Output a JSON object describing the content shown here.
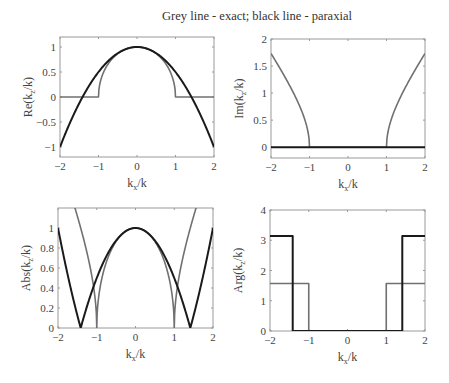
{
  "figure": {
    "title": "Grey line - exact; black line - paraxial",
    "colors": {
      "exact": "#707070",
      "paraxial": "#1a1a1a",
      "axes": "#9a9a9a",
      "text": "#444444"
    }
  },
  "chart_data": [
    {
      "id": "re",
      "type": "line",
      "title": "",
      "xlabel": "k_x/k",
      "ylabel": "Re(k_z/k)",
      "xlim": [
        -2,
        2
      ],
      "ylim": [
        -1.2,
        1.2
      ],
      "xticks": [
        -2,
        -1,
        0,
        1,
        2
      ],
      "xticklabels": [
        "−2",
        "−1",
        "0",
        "1",
        "2"
      ],
      "yticks": [
        -1,
        -0.5,
        0,
        0.5,
        1
      ],
      "yticklabels": [
        "−1",
        "−0.5",
        "0",
        "0.5",
        "1"
      ],
      "grid": false,
      "legend": "none",
      "series": [
        {
          "name": "exact",
          "color": "grey",
          "formula": "Re(sqrt(1 - x^2))",
          "x": [
            -2,
            -1,
            -0.75,
            -0.5,
            -0.25,
            0,
            0.25,
            0.5,
            0.75,
            1,
            2
          ],
          "y": [
            0,
            0,
            0.66,
            0.87,
            0.97,
            1,
            0.97,
            0.87,
            0.66,
            0,
            0
          ]
        },
        {
          "name": "paraxial",
          "color": "black",
          "formula": "1 - x^2/2",
          "x": [
            -2,
            -1.5,
            -1,
            -0.5,
            0,
            0.5,
            1,
            1.5,
            2
          ],
          "y": [
            -1,
            -0.125,
            0.5,
            0.875,
            1,
            0.875,
            0.5,
            -0.125,
            -1
          ]
        }
      ]
    },
    {
      "id": "im",
      "type": "line",
      "title": "",
      "xlabel": "k_x/k",
      "ylabel": "Im(k_z/k)",
      "xlim": [
        -2,
        2
      ],
      "ylim": [
        -0.2,
        2
      ],
      "xticks": [
        -2,
        -1,
        0,
        1,
        2
      ],
      "xticklabels": [
        "−2",
        "−1",
        "0",
        "1",
        "2"
      ],
      "yticks": [
        0,
        0.5,
        1,
        1.5,
        2
      ],
      "yticklabels": [
        "0",
        "0.5",
        "1",
        "1.5",
        "2"
      ],
      "grid": false,
      "legend": "none",
      "series": [
        {
          "name": "exact",
          "color": "grey",
          "formula": "Im(sqrt(1 - x^2))",
          "x": [
            -2,
            -1.5,
            -1.2,
            -1,
            1,
            1.2,
            1.5,
            2
          ],
          "y": [
            1.73,
            1.12,
            0.66,
            0,
            0,
            0.66,
            1.12,
            1.73
          ]
        },
        {
          "name": "paraxial",
          "color": "black",
          "formula": "0",
          "x": [
            -2,
            2
          ],
          "y": [
            0,
            0
          ]
        }
      ]
    },
    {
      "id": "abs",
      "type": "line",
      "title": "",
      "xlabel": "k_x/k",
      "ylabel": "Abs(k_z/k)",
      "xlim": [
        -2,
        2
      ],
      "ylim": [
        0,
        1.2
      ],
      "xticks": [
        -2,
        -1,
        0,
        1,
        2
      ],
      "xticklabels": [
        "−2",
        "−1",
        "0",
        "1",
        "2"
      ],
      "yticks": [
        0,
        0.2,
        0.4,
        0.6,
        0.8,
        1
      ],
      "yticklabels": [
        "0",
        "0.2",
        "0.4",
        "0.6",
        "0.8",
        "1"
      ],
      "grid": false,
      "legend": "none",
      "series": [
        {
          "name": "exact",
          "color": "grey",
          "formula": "abs(sqrt(1 - x^2))",
          "x": [
            -2,
            -1.5,
            -1.2,
            -1,
            -0.5,
            0,
            0.5,
            1,
            1.2,
            1.5,
            2
          ],
          "y": [
            1.73,
            1.12,
            0.66,
            0,
            0.87,
            1,
            0.87,
            0,
            0.66,
            1.12,
            1.73
          ]
        },
        {
          "name": "paraxial",
          "color": "black",
          "formula": "abs(1 - x^2/2)",
          "x": [
            -2,
            -1.414,
            -1,
            -0.5,
            0,
            0.5,
            1,
            1.414,
            2
          ],
          "y": [
            1,
            0,
            0.5,
            0.875,
            1,
            0.875,
            0.5,
            0,
            1
          ]
        }
      ]
    },
    {
      "id": "arg",
      "type": "line",
      "title": "",
      "xlabel": "k_x/k",
      "ylabel": "Arg(k_z/k)",
      "xlim": [
        -2,
        2
      ],
      "ylim": [
        0,
        4
      ],
      "xticks": [
        -2,
        -1,
        0,
        1,
        2
      ],
      "xticklabels": [
        "−2",
        "−1",
        "0",
        "1",
        "2"
      ],
      "yticks": [
        0,
        1,
        2,
        3,
        4
      ],
      "yticklabels": [
        "0",
        "1",
        "2",
        "3",
        "4"
      ],
      "grid": false,
      "legend": "none",
      "series": [
        {
          "name": "exact",
          "color": "grey",
          "formula": "arg(sqrt(1 - x^2))",
          "x": [
            -2,
            -1,
            -1,
            1,
            1,
            2
          ],
          "y": [
            1.5708,
            1.5708,
            0,
            0,
            1.5708,
            1.5708
          ]
        },
        {
          "name": "paraxial",
          "color": "black",
          "formula": "arg(1 - x^2/2)",
          "x": [
            -2,
            -1.414,
            -1.414,
            1.414,
            1.414,
            2
          ],
          "y": [
            3.1416,
            3.1416,
            0,
            0,
            3.1416,
            3.1416
          ]
        }
      ]
    }
  ]
}
